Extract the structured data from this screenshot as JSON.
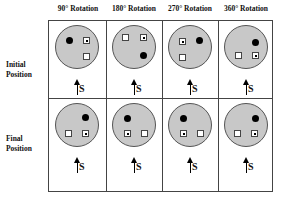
{
  "columns": [
    {
      "label": "90° Rotation"
    },
    {
      "label": "180° Rotation"
    },
    {
      "label": "270° Rotation"
    },
    {
      "label": "360° Rotation"
    }
  ],
  "rows": [
    {
      "label_line1": "Initial",
      "label_line2": "Position"
    },
    {
      "label_line1": "Final",
      "label_line2": "Position"
    }
  ],
  "arrow_label": "S",
  "colors": {
    "disc": "#c8c8c8",
    "grid": "#444444",
    "dot": "#000000"
  },
  "cells": {
    "initial": [
      {
        "dot": [
          10,
          11
        ],
        "squares": [
          {
            "pos": [
              27,
              11
            ],
            "marked": true
          },
          {
            "pos": [
              27,
              27
            ],
            "marked": false
          }
        ]
      },
      {
        "dot": [
          27,
          26
        ],
        "squares": [
          {
            "pos": [
              9,
              8
            ],
            "marked": false
          },
          {
            "pos": [
              27,
              8
            ],
            "marked": true
          }
        ]
      },
      {
        "dot": [
          27,
          11
        ],
        "squares": [
          {
            "pos": [
              10,
              12
            ],
            "marked": true
          },
          {
            "pos": [
              10,
              28
            ],
            "marked": false
          }
        ]
      },
      {
        "dot": [
          27,
          13
        ],
        "squares": [
          {
            "pos": [
              10,
              26
            ],
            "marked": false
          },
          {
            "pos": [
              27,
              26
            ],
            "marked": true
          }
        ]
      }
    ],
    "final": [
      {
        "dot": [
          26,
          10
        ],
        "squares": [
          {
            "pos": [
              9,
              26
            ],
            "marked": false
          },
          {
            "pos": [
              26,
              26
            ],
            "marked": true
          }
        ]
      },
      {
        "dot": [
          11,
          11
        ],
        "squares": [
          {
            "pos": [
              11,
              26
            ],
            "marked": true
          },
          {
            "pos": [
              28,
              26
            ],
            "marked": false
          }
        ]
      },
      {
        "dot": [
          11,
          11
        ],
        "squares": [
          {
            "pos": [
              11,
              26
            ],
            "marked": true
          },
          {
            "pos": [
              28,
              26
            ],
            "marked": false
          }
        ]
      },
      {
        "dot": [
          27,
          11
        ],
        "squares": [
          {
            "pos": [
              9,
              26
            ],
            "marked": false
          },
          {
            "pos": [
              26,
              26
            ],
            "marked": true
          }
        ]
      }
    ]
  }
}
